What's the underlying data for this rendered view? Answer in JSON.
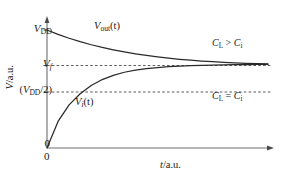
{
  "chart_data": {
    "type": "line",
    "title": "",
    "xlabel": "t/a.u.",
    "ylabel": "V/a.u.",
    "grid": false,
    "legend": "none",
    "xlim": [
      0,
      1
    ],
    "ylim": [
      0,
      1
    ],
    "axis_arrows": true,
    "y_ticks": [
      {
        "label": "V_DD",
        "value": 1.0
      },
      {
        "label": "V_f",
        "value": 0.7
      },
      {
        "label": "(V_DD/2)",
        "value": 0.5
      },
      {
        "label": "0",
        "value": 0.0
      }
    ],
    "x_ticks": [
      {
        "label": "0",
        "value": 0.0
      }
    ],
    "reference_lines": [
      {
        "name": "v-f-line",
        "y": 0.7,
        "style": "dashed",
        "label": "V_f"
      },
      {
        "name": "v-dd-half-line",
        "y": 0.5,
        "style": "dashed",
        "label": "(V_DD/2)"
      }
    ],
    "series": [
      {
        "name": "V_out(t)",
        "style": "solid",
        "start": 1.0,
        "asymptote": 0.7,
        "direction": "decaying",
        "x": [
          0.0,
          0.05,
          0.1,
          0.15,
          0.2,
          0.25,
          0.3,
          0.35,
          0.4,
          0.45,
          0.5,
          0.55,
          0.6,
          0.65,
          0.7,
          0.75,
          0.8,
          0.85,
          0.9,
          0.95,
          1.0
        ],
        "y": [
          1.0,
          0.963,
          0.93,
          0.901,
          0.875,
          0.852,
          0.832,
          0.814,
          0.798,
          0.784,
          0.772,
          0.761,
          0.752,
          0.744,
          0.737,
          0.731,
          0.726,
          0.722,
          0.718,
          0.715,
          0.712
        ]
      },
      {
        "name": "V_i(t)",
        "style": "solid",
        "start": 0.0,
        "asymptote": 0.7,
        "direction": "rising",
        "x": [
          0.0,
          0.05,
          0.1,
          0.15,
          0.2,
          0.25,
          0.3,
          0.35,
          0.4,
          0.45,
          0.5,
          0.55,
          0.6,
          0.65,
          0.7,
          0.75,
          0.8,
          0.85,
          0.9,
          0.95,
          1.0
        ],
        "y": [
          0.0,
          0.225,
          0.365,
          0.46,
          0.53,
          0.58,
          0.616,
          0.642,
          0.66,
          0.673,
          0.682,
          0.689,
          0.694,
          0.698,
          0.701,
          0.703,
          0.705,
          0.706,
          0.707,
          0.708,
          0.709
        ]
      }
    ],
    "annotations": [
      {
        "name": "cl-greater",
        "text": "C_L > C_i",
        "x": 0.78,
        "y": 0.88
      },
      {
        "name": "cl-equal",
        "text": "C_L = C_i",
        "x": 0.78,
        "y": 0.4
      }
    ]
  },
  "labels": {
    "v_dd": {
      "base": "V",
      "sub": "DD"
    },
    "v_f": {
      "base": "V",
      "sub": "f"
    },
    "v_dd_half": {
      "open": "(",
      "base": "V",
      "sub": "DD",
      "close": "/2)"
    },
    "zero_y": "0",
    "zero_x": "0",
    "y_axis_title": {
      "base": "V",
      "rest": "/a.u."
    },
    "x_axis_title": {
      "base": "t",
      "rest": "/a.u."
    },
    "v_out": {
      "base": "V",
      "sub": "out",
      "rest": "(t)"
    },
    "v_i": {
      "base": "V",
      "sub": "i",
      "rest": "(t)"
    },
    "cl_greater": {
      "base": "C",
      "sub": "L",
      "op": " > ",
      "base2": "C",
      "sub2": "i"
    },
    "cl_equal": {
      "base": "C",
      "sub": "L",
      "op": " = ",
      "base2": "C",
      "sub2": "i"
    }
  },
  "colors": {
    "axis": "#6e6e6e",
    "curve": "#2a2a2a",
    "dashed": "#4a4a4a",
    "text": "#1a1a1a",
    "background": "#ffffff"
  }
}
